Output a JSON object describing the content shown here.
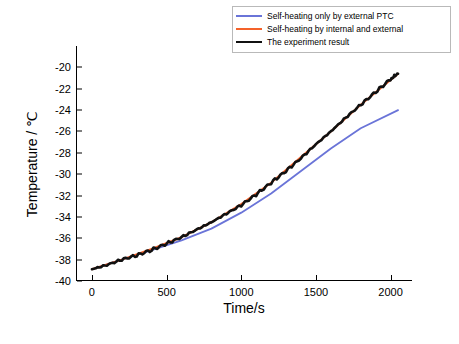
{
  "chart_data": {
    "type": "line",
    "title": "",
    "xlabel": "Time/s",
    "ylabel": "Temperature / ℃",
    "xlim": [
      -100,
      2150
    ],
    "ylim": [
      -40,
      -18
    ],
    "xticks": [
      0,
      500,
      1000,
      1500,
      2000
    ],
    "yticks": [
      -20,
      -22,
      -24,
      -26,
      -28,
      -30,
      -32,
      -34,
      -36,
      -38,
      -40
    ],
    "grid": false,
    "legend_position": "top-right",
    "series": [
      {
        "name": "Self-heating only by external PTC",
        "color": "#6a74d8",
        "x": [
          0,
          200,
          400,
          600,
          800,
          1000,
          1200,
          1400,
          1600,
          1800,
          2050
        ],
        "y": [
          -38.9,
          -38.0,
          -37.1,
          -36.2,
          -35.1,
          -33.6,
          -31.8,
          -29.7,
          -27.6,
          -25.7,
          -24.0
        ]
      },
      {
        "name": "Self-heating by internal and external",
        "color": "#f4622a",
        "x": [
          0,
          200,
          400,
          600,
          800,
          1000,
          1200,
          1400,
          1600,
          1800,
          2050
        ],
        "y": [
          -38.9,
          -38.0,
          -37.0,
          -35.9,
          -34.5,
          -32.8,
          -30.8,
          -28.4,
          -26.0,
          -23.5,
          -20.6
        ]
      },
      {
        "name": "The experiment result",
        "color": "#111111",
        "x": [
          0,
          100,
          200,
          300,
          400,
          500,
          600,
          700,
          800,
          900,
          1000,
          1100,
          1200,
          1300,
          1400,
          1500,
          1600,
          1700,
          1800,
          1900,
          2000,
          2050
        ],
        "y": [
          -38.9,
          -38.5,
          -38.0,
          -37.6,
          -37.1,
          -36.5,
          -35.9,
          -35.2,
          -34.5,
          -33.7,
          -32.9,
          -31.9,
          -30.8,
          -29.7,
          -28.5,
          -27.2,
          -26.0,
          -24.7,
          -23.5,
          -22.3,
          -21.1,
          -20.6
        ]
      }
    ]
  },
  "legend": {
    "items": [
      {
        "label": "Self-heating only by external PTC",
        "color": "#6a74d8"
      },
      {
        "label": "Self-heating by internal and external",
        "color": "#f4622a"
      },
      {
        "label": "The experiment result",
        "color": "#111111"
      }
    ]
  },
  "axes": {
    "x_title": "Time/s",
    "y_title": "Temperature / ℃",
    "xticks": [
      "0",
      "500",
      "1000",
      "1500",
      "2000"
    ],
    "yticks": [
      "-20",
      "-22",
      "-24",
      "-26",
      "-28",
      "-30",
      "-32",
      "-34",
      "-36",
      "-38",
      "-40"
    ]
  }
}
